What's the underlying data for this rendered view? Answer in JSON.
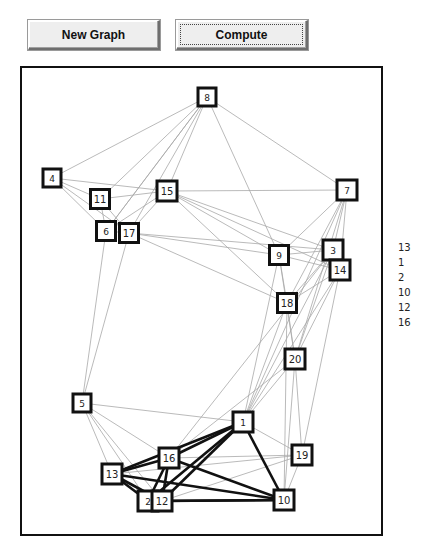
{
  "toolbar": {
    "new_graph_label": "New Graph",
    "compute_label": "Compute"
  },
  "results": {
    "items": [
      "13",
      "1",
      "2",
      "10",
      "12",
      "16"
    ]
  },
  "graph": {
    "colors": {
      "edge_normal": "#a8a8a8",
      "edge_highlight": "#111111",
      "node_border": "#111111",
      "node_fill": "#ffffff",
      "label": "#222222"
    },
    "nodes": [
      {
        "id": "1",
        "x": 243,
        "y": 422,
        "size": 20
      },
      {
        "id": "2",
        "x": 148,
        "y": 501,
        "size": 20
      },
      {
        "id": "3",
        "x": 333,
        "y": 250,
        "size": 20
      },
      {
        "id": "4",
        "x": 52,
        "y": 178,
        "size": 18
      },
      {
        "id": "5",
        "x": 82,
        "y": 403,
        "size": 18
      },
      {
        "id": "6",
        "x": 106,
        "y": 231,
        "size": 19
      },
      {
        "id": "7",
        "x": 347,
        "y": 190,
        "size": 20
      },
      {
        "id": "8",
        "x": 207,
        "y": 97,
        "size": 18
      },
      {
        "id": "9",
        "x": 279,
        "y": 255,
        "size": 19
      },
      {
        "id": "10",
        "x": 284,
        "y": 500,
        "size": 20
      },
      {
        "id": "11",
        "x": 100,
        "y": 199,
        "size": 19
      },
      {
        "id": "12",
        "x": 162,
        "y": 501,
        "size": 20
      },
      {
        "id": "13",
        "x": 112,
        "y": 474,
        "size": 20
      },
      {
        "id": "14",
        "x": 340,
        "y": 270,
        "size": 20
      },
      {
        "id": "15",
        "x": 167,
        "y": 191,
        "size": 20
      },
      {
        "id": "16",
        "x": 169,
        "y": 458,
        "size": 20
      },
      {
        "id": "17",
        "x": 129,
        "y": 233,
        "size": 19
      },
      {
        "id": "18",
        "x": 287,
        "y": 303,
        "size": 19
      },
      {
        "id": "19",
        "x": 302,
        "y": 455,
        "size": 20
      },
      {
        "id": "20",
        "x": 295,
        "y": 359,
        "size": 20
      }
    ],
    "edges": [
      [
        "8",
        "4"
      ],
      [
        "8",
        "11"
      ],
      [
        "8",
        "6"
      ],
      [
        "8",
        "17"
      ],
      [
        "8",
        "15"
      ],
      [
        "8",
        "9"
      ],
      [
        "8",
        "7"
      ],
      [
        "8",
        "6"
      ],
      [
        "4",
        "15"
      ],
      [
        "4",
        "11"
      ],
      [
        "4",
        "6"
      ],
      [
        "4",
        "17"
      ],
      [
        "11",
        "15"
      ],
      [
        "11",
        "6"
      ],
      [
        "11",
        "17"
      ],
      [
        "15",
        "7"
      ],
      [
        "15",
        "6"
      ],
      [
        "15",
        "17"
      ],
      [
        "15",
        "9"
      ],
      [
        "15",
        "3"
      ],
      [
        "15",
        "18"
      ],
      [
        "15",
        "14"
      ],
      [
        "6",
        "17"
      ],
      [
        "6",
        "5"
      ],
      [
        "17",
        "9"
      ],
      [
        "17",
        "3"
      ],
      [
        "17",
        "5"
      ],
      [
        "17",
        "18"
      ],
      [
        "7",
        "9"
      ],
      [
        "7",
        "3"
      ],
      [
        "7",
        "14"
      ],
      [
        "7",
        "18"
      ],
      [
        "7",
        "20"
      ],
      [
        "7",
        "1"
      ],
      [
        "9",
        "3"
      ],
      [
        "9",
        "14"
      ],
      [
        "9",
        "18"
      ],
      [
        "9",
        "1"
      ],
      [
        "9",
        "20"
      ],
      [
        "3",
        "14"
      ],
      [
        "3",
        "18"
      ],
      [
        "3",
        "20"
      ],
      [
        "3",
        "1"
      ],
      [
        "3",
        "16"
      ],
      [
        "14",
        "18"
      ],
      [
        "14",
        "20"
      ],
      [
        "14",
        "19"
      ],
      [
        "14",
        "1"
      ],
      [
        "18",
        "20"
      ],
      [
        "18",
        "1"
      ],
      [
        "18",
        "10"
      ],
      [
        "20",
        "19"
      ],
      [
        "20",
        "10"
      ],
      [
        "20",
        "16"
      ],
      [
        "20",
        "1"
      ],
      [
        "5",
        "1"
      ],
      [
        "5",
        "13"
      ],
      [
        "5",
        "16"
      ],
      [
        "5",
        "2"
      ],
      [
        "5",
        "12"
      ],
      [
        "1",
        "19"
      ],
      [
        "16",
        "19"
      ],
      [
        "13",
        "19"
      ],
      [
        "12",
        "19"
      ],
      [
        "19",
        "10"
      ]
    ],
    "highlight_edges": [
      [
        "13",
        "1"
      ],
      [
        "13",
        "16"
      ],
      [
        "13",
        "2"
      ],
      [
        "13",
        "12"
      ],
      [
        "13",
        "10"
      ],
      [
        "1",
        "16"
      ],
      [
        "1",
        "2"
      ],
      [
        "1",
        "12"
      ],
      [
        "1",
        "10"
      ],
      [
        "16",
        "2"
      ],
      [
        "16",
        "12"
      ],
      [
        "16",
        "10"
      ],
      [
        "2",
        "12"
      ],
      [
        "2",
        "10"
      ],
      [
        "12",
        "10"
      ]
    ]
  }
}
